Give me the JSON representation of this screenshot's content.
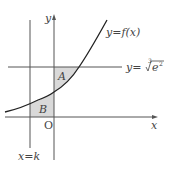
{
  "diagram": {
    "type": "function-graph",
    "axes": {
      "x_label": "x",
      "y_label": "y",
      "origin_label": "O"
    },
    "curve": {
      "label": "y=f(x)",
      "description": "increasing exponential-like curve"
    },
    "horizontal_line": {
      "label_prefix": "y=",
      "root_index": "3",
      "radicand_base": "e",
      "radicand_exp": "2",
      "label": "y=∛(e²)"
    },
    "vertical_line": {
      "label": "x=k"
    },
    "regions": [
      {
        "name": "A",
        "label": "A",
        "description": "bounded by y-axis, curve, and line y=∛(e²)"
      },
      {
        "name": "B",
        "label": "B",
        "description": "bounded by x=k, curve, x-axis, and y-axis"
      }
    ],
    "colors": {
      "line": "#555555",
      "curve": "#222222",
      "shade": "#d9d9d9"
    }
  }
}
